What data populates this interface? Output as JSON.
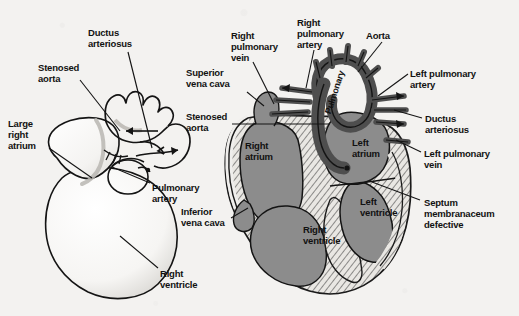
{
  "figure": {
    "background_color": "#f3f2f0",
    "ink_color": "#111111",
    "chamber_fill": "#8c8c8c",
    "vessel_dark_fill": "#4e4e4e",
    "myocardium_fill": "#e8e6e2",
    "panels": [
      {
        "name": "external-view",
        "description": "External view of heart, line drawing"
      },
      {
        "name": "cross-section-view",
        "description": "Coronal cross-section of heart, shaded"
      }
    ]
  },
  "left_panel": {
    "name": "external-view",
    "labels": [
      {
        "id": "ductus-arteriosus",
        "text": "Ductus\narteriosus",
        "x": 88,
        "y": 27
      },
      {
        "id": "stenosed-aorta",
        "text": "Stenosed\naorta",
        "x": 38,
        "y": 62
      },
      {
        "id": "large-right-atrium",
        "text": "Large\nright\natrium",
        "x": 8,
        "y": 118
      },
      {
        "id": "pulmonary-artery",
        "text": "Pulmonary\nartery",
        "x": 152,
        "y": 182
      },
      {
        "id": "right-ventricle",
        "text": "Right\nventricle",
        "x": 160,
        "y": 268
      }
    ]
  },
  "right_panel": {
    "name": "cross-section-view",
    "callout_labels": [
      {
        "id": "right-pulmonary-vein",
        "text": "Right\npulmonary\nvein",
        "x": 231,
        "y": 30
      },
      {
        "id": "right-pulmonary-artery",
        "text": "Right\npulmonary\nartery",
        "x": 297,
        "y": 17
      },
      {
        "id": "aorta",
        "text": "Aorta",
        "x": 366,
        "y": 30
      },
      {
        "id": "superior-vena-cava",
        "text": "Superior\nvena cava",
        "x": 186,
        "y": 67
      },
      {
        "id": "stenosed-aorta-right",
        "text": "Stenosed\naorta",
        "x": 186,
        "y": 111
      },
      {
        "id": "inferior-vena-cava",
        "text": "Inferior\nvena cava",
        "x": 181,
        "y": 206
      },
      {
        "id": "left-pulmonary-artery",
        "text": "Left pulmonary\nartery",
        "x": 410,
        "y": 68
      },
      {
        "id": "ductus-arteriosus-right",
        "text": "Ductus\narteriosus",
        "x": 425,
        "y": 113
      },
      {
        "id": "left-pulmonary-vein",
        "text": "Left pulmonary\nvein",
        "x": 424,
        "y": 148
      },
      {
        "id": "septum-membranaceum-defective",
        "text": "Septum\nmembranaceum\ndefective",
        "x": 424,
        "y": 197
      }
    ],
    "inner_labels": [
      {
        "id": "right-atrium",
        "text": "Right\natrium",
        "x": 245,
        "y": 140
      },
      {
        "id": "left-atrium",
        "text": "Left\natrium",
        "x": 352,
        "y": 137
      },
      {
        "id": "right-ventricle-inner",
        "text": "Right\nventricle",
        "x": 303,
        "y": 224
      },
      {
        "id": "left-ventricle-inner",
        "text": "Left\nventricle",
        "x": 360,
        "y": 196
      },
      {
        "id": "pulmonary-artery-inner",
        "text": "Pulmonary",
        "x": 323,
        "y": 112,
        "rotate": -72
      }
    ]
  }
}
